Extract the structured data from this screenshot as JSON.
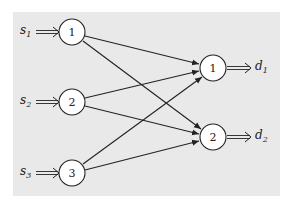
{
  "diagram": {
    "type": "bipartite-flow-network",
    "background_color": "#e9e9e9",
    "sources": [
      {
        "id": "s1",
        "node_label": "1",
        "input_label": "s",
        "input_sub": "1"
      },
      {
        "id": "s2",
        "node_label": "2",
        "input_label": "s",
        "input_sub": "2"
      },
      {
        "id": "s3",
        "node_label": "3",
        "input_label": "s",
        "input_sub": "3"
      }
    ],
    "sinks": [
      {
        "id": "t1",
        "node_label": "1",
        "output_label": "d",
        "output_sub": "1"
      },
      {
        "id": "t2",
        "node_label": "2",
        "output_label": "d",
        "output_sub": "2"
      }
    ],
    "edges": [
      {
        "from": "s1",
        "to": "t1"
      },
      {
        "from": "s1",
        "to": "t2"
      },
      {
        "from": "s2",
        "to": "t1"
      },
      {
        "from": "s2",
        "to": "t2"
      },
      {
        "from": "s3",
        "to": "t1"
      },
      {
        "from": "s3",
        "to": "t2"
      }
    ]
  }
}
